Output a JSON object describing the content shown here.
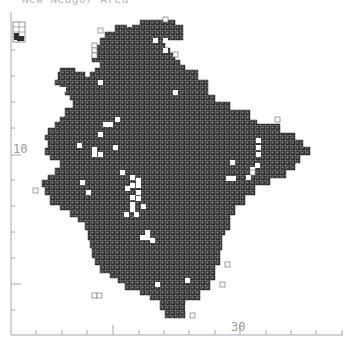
{
  "figure": {
    "title": "New Neagor Area",
    "type": "grid-cell distribution map"
  },
  "axes": {
    "y": {
      "label": "10",
      "tick_count": 12
    },
    "x": {
      "label": "30",
      "tick_count": 13
    }
  },
  "legend": {
    "inset": "small grid-cell key (top-left)"
  },
  "colors": {
    "cell_fill": "#2e2e2e",
    "grid_line": "#cfcfcf",
    "empty_cell_outline": "#777777",
    "axis": "#a8a8a8"
  }
}
